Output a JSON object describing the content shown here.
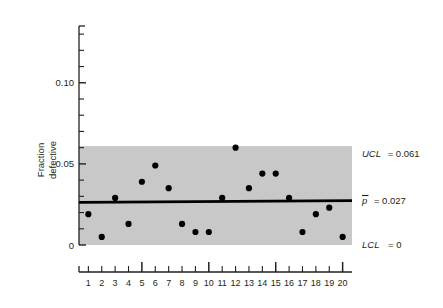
{
  "chart_data": {
    "type": "scatter",
    "title": "",
    "xlabel": "",
    "ylabel": "Fraction defective",
    "ylabel_line1": "Fraction",
    "ylabel_line2": "defective",
    "x": [
      1,
      2,
      3,
      4,
      5,
      6,
      7,
      8,
      9,
      10,
      11,
      12,
      13,
      14,
      15,
      16,
      17,
      18,
      19,
      20
    ],
    "values": [
      0.019,
      0.005,
      0.029,
      0.013,
      0.039,
      0.049,
      0.035,
      0.013,
      0.008,
      0.008,
      0.029,
      0.06,
      0.035,
      0.044,
      0.044,
      0.029,
      0.008,
      0.019,
      0.023,
      0.005
    ],
    "xtick_labels": [
      "1",
      "2",
      "3",
      "4",
      "5",
      "6",
      "7",
      "8",
      "9",
      "10",
      "11",
      "12",
      "13",
      "14",
      "15",
      "16",
      "17",
      "18",
      "19",
      "20"
    ],
    "major_xticks": [
      5,
      10,
      15,
      20
    ],
    "ytick_labels": [
      "0",
      "0.05",
      "0.10"
    ],
    "ytick_values": [
      0,
      0.05,
      0.1
    ],
    "yminor_step": 0.01,
    "ylim": [
      0,
      0.135
    ],
    "xlim": [
      0.3,
      20.7
    ],
    "grid": false,
    "legend": "none",
    "center_line": 0.027,
    "upper_control_limit": 0.061,
    "lower_control_limit": 0,
    "band_color": "#c8c8c8",
    "point_color": "#000000",
    "line_color": "#000000"
  },
  "annotations": {
    "ucl": {
      "symbol": "UCL",
      "equals": "= 0.061",
      "full": "UCL = 0.061"
    },
    "pbar": {
      "symbol": "p",
      "equals": "= 0.027",
      "full": "p̄ = 0.027"
    },
    "lcl": {
      "symbol": "LCL",
      "equals": "= 0",
      "full": "LCL = 0"
    }
  }
}
